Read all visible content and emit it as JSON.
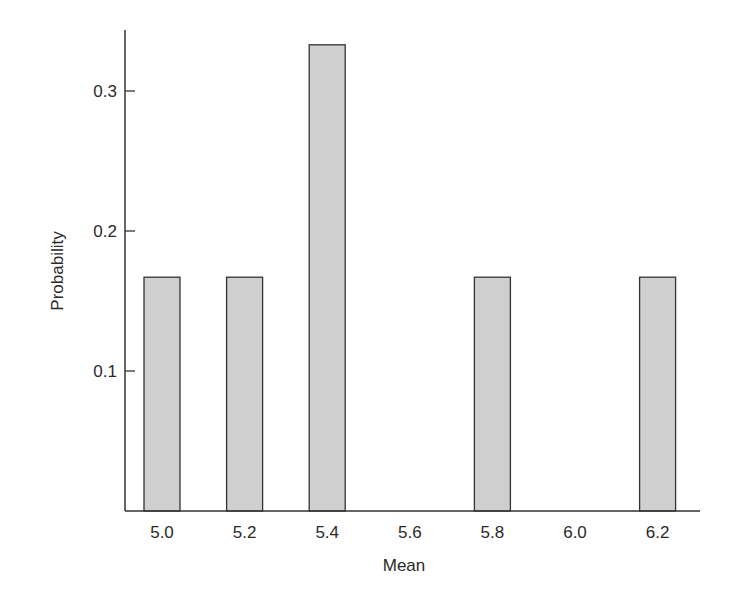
{
  "chart_data": {
    "type": "bar",
    "title": "",
    "xlabel": "Mean",
    "ylabel": "Probability",
    "categories": [
      "5.0",
      "5.2",
      "5.4",
      "5.6",
      "5.8",
      "6.0",
      "6.2"
    ],
    "values": [
      0.167,
      0.167,
      0.333,
      0,
      0.167,
      0,
      0.167
    ],
    "ylim": [
      0,
      0.34
    ],
    "yticks": [
      "0.1",
      "0.2",
      "0.3"
    ],
    "ytick_values": [
      0.1,
      0.2,
      0.3
    ],
    "grid": false,
    "legend": null,
    "bar_color": "#cfcfcf",
    "bar_edge_color": "#333333"
  }
}
